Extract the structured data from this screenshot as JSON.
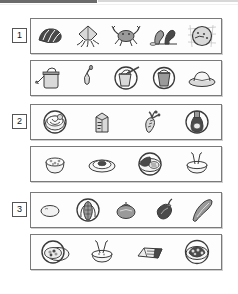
{
  "document": {
    "type": "picture-sorting-worksheet",
    "title": "Picture sorting worksheet",
    "group_count": 3,
    "rows_per_group": 2
  },
  "decor": {
    "top_bar_dark_color": "#6b6b6b",
    "top_bar_light_color": "#d8d8d8"
  },
  "colors": {
    "panel_border": "#7a7a7a",
    "number_box_border": "#555555",
    "ink": "#3a3a3a",
    "fill_light": "#d9d9d9",
    "fill_mid": "#9a9a9a",
    "fill_dark": "#4a4a4a",
    "paper": "#fdfdfd"
  },
  "groups": [
    {
      "number": "1",
      "rows": [
        {
          "row_id": "group-1-row-1",
          "items": [
            {
              "name": "seashell",
              "label": "seashell",
              "circled": false
            },
            {
              "name": "squid",
              "label": "squid",
              "circled": false
            },
            {
              "name": "crab",
              "label": "crab",
              "circled": false
            },
            {
              "name": "seaweed",
              "label": "seaweed",
              "circled": false
            },
            {
              "name": "fish-bowl",
              "label": "fish bowl",
              "circled": true
            }
          ]
        },
        {
          "row_id": "group-1-row-2",
          "items": [
            {
              "name": "watering-can",
              "label": "watering can",
              "circled": false
            },
            {
              "name": "trowel",
              "label": "trowel",
              "circled": false
            },
            {
              "name": "bucket-and-rake",
              "label": "bucket and rake",
              "circled": true
            },
            {
              "name": "sand-bucket",
              "label": "sand bucket",
              "circled": true
            },
            {
              "name": "sun-hat",
              "label": "sun hat",
              "circled": false
            }
          ]
        }
      ]
    },
    {
      "number": "2",
      "rows": [
        {
          "row_id": "group-2-row-1",
          "items": [
            {
              "name": "mixing-bowl",
              "label": "mixing bowl",
              "circled": true
            },
            {
              "name": "milk-carton",
              "label": "milk carton",
              "circled": false
            },
            {
              "name": "carrot",
              "label": "carrot",
              "circled": false
            },
            {
              "name": "syrup-bottle",
              "label": "syrup bottle",
              "circled": true
            }
          ]
        },
        {
          "row_id": "group-2-row-2",
          "items": [
            {
              "name": "cereal-bowl",
              "label": "cereal bowl",
              "circled": false
            },
            {
              "name": "pancake-plate",
              "label": "pancake plate",
              "circled": false
            },
            {
              "name": "dinner-plate",
              "label": "dinner plate",
              "circled": true
            },
            {
              "name": "soup-bowl",
              "label": "soup bowl",
              "circled": false
            }
          ]
        }
      ]
    },
    {
      "number": "3",
      "rows": [
        {
          "row_id": "group-3-row-1",
          "items": [
            {
              "name": "potato",
              "label": "potato",
              "circled": false
            },
            {
              "name": "corn-cob",
              "label": "corn on the cob",
              "circled": true
            },
            {
              "name": "tomato",
              "label": "tomato",
              "circled": false
            },
            {
              "name": "eggplant",
              "label": "eggplant",
              "circled": false
            },
            {
              "name": "zucchini",
              "label": "zucchini",
              "circled": false
            }
          ]
        },
        {
          "row_id": "group-3-row-2",
          "items": [
            {
              "name": "salad-plate",
              "label": "salad plate",
              "circled": true
            },
            {
              "name": "soup-bowl-straws",
              "label": "soup bowl with straws",
              "circled": false
            },
            {
              "name": "sandwich-wrap",
              "label": "sandwich wrap",
              "circled": false
            },
            {
              "name": "veggie-plate",
              "label": "vegetable plate",
              "circled": true
            }
          ]
        }
      ]
    }
  ]
}
